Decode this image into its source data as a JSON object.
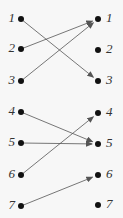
{
  "diagram": {
    "type": "mapping",
    "left_nodes": [
      {
        "label": "1",
        "x": 21,
        "y": 19
      },
      {
        "label": "2",
        "x": 21,
        "y": 49
      },
      {
        "label": "3",
        "x": 21,
        "y": 81
      },
      {
        "label": "4",
        "x": 21,
        "y": 112
      },
      {
        "label": "5",
        "x": 21,
        "y": 143
      },
      {
        "label": "6",
        "x": 21,
        "y": 175
      },
      {
        "label": "7",
        "x": 21,
        "y": 206
      }
    ],
    "right_nodes": [
      {
        "label": "1",
        "x": 98,
        "y": 19
      },
      {
        "label": "2",
        "x": 98,
        "y": 50
      },
      {
        "label": "3",
        "x": 98,
        "y": 81
      },
      {
        "label": "4",
        "x": 98,
        "y": 113
      },
      {
        "label": "5",
        "x": 98,
        "y": 144
      },
      {
        "label": "6",
        "x": 98,
        "y": 175
      },
      {
        "label": "7",
        "x": 98,
        "y": 205
      }
    ],
    "edges": [
      {
        "from": 1,
        "to": 3
      },
      {
        "from": 2,
        "to": 1
      },
      {
        "from": 3,
        "to": 1
      },
      {
        "from": 4,
        "to": 5
      },
      {
        "from": 5,
        "to": 5
      },
      {
        "from": 6,
        "to": 4
      },
      {
        "from": 7,
        "to": 6
      }
    ],
    "colors": {
      "node": "#111111",
      "edge": "#555555",
      "label": "#333333"
    }
  }
}
